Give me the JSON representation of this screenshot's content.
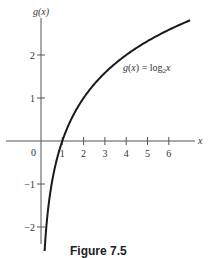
{
  "chart_data": {
    "type": "line",
    "title": "",
    "function_label": "g(x) = log₂x",
    "xlabel": "x",
    "ylabel": "g(x)",
    "xlim": [
      -1.9,
      7.4
    ],
    "ylim": [
      -2.4,
      3.0
    ],
    "x_ticks": [
      1,
      2,
      3,
      4,
      5,
      6
    ],
    "x_tick_labels": [
      "1",
      "2",
      "3",
      "4",
      "5",
      "6"
    ],
    "y_ticks": [
      -2,
      -1,
      1,
      2
    ],
    "y_tick_labels": [
      "−2",
      "−1",
      "1",
      "2"
    ],
    "origin_label": "0",
    "grid": false,
    "legend": null,
    "series": [
      {
        "name": "g(x) = log₂x",
        "x": [
          0.16,
          0.25,
          0.5,
          1,
          2,
          3,
          4,
          5,
          6,
          7
        ],
        "y": [
          -2.64,
          -2,
          -1,
          0,
          1,
          1.585,
          2,
          2.322,
          2.585,
          2.807
        ]
      }
    ]
  },
  "caption": "Figure 7.5"
}
